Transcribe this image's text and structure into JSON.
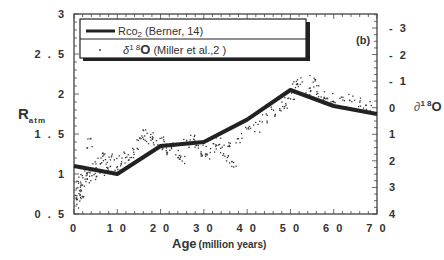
{
  "chart_data": {
    "type": "line+scatter",
    "panel_label": "(b)",
    "title": "",
    "xlabel": "Age",
    "xlabel_units": "(million years)",
    "ylabel": "R",
    "ylabel_sub": "atm",
    "y2label": "∂¹⁸O",
    "xlim": [
      0,
      70
    ],
    "ylim": [
      0.5,
      3
    ],
    "y2lim": [
      4,
      -3.5
    ],
    "y2_reversed": true,
    "grid": false,
    "legend_position": "upper-left",
    "x_ticks": [
      "0",
      "1 0",
      "2 0",
      "3 0",
      "4 0",
      "5 0",
      "6 0",
      "7 0"
    ],
    "x_tick_values": [
      0,
      10,
      20,
      30,
      40,
      50,
      60,
      70
    ],
    "y_ticks": [
      "0 . 5",
      "1",
      "1 . 5",
      "2",
      "2 . 5",
      "3"
    ],
    "y_tick_values": [
      0.5,
      1,
      1.5,
      2,
      2.5,
      3
    ],
    "y2_ticks": [
      "- 3",
      "- 2",
      "- 1",
      "0",
      "1",
      "2",
      "3",
      "4"
    ],
    "y2_tick_values": [
      -3,
      -2,
      -1,
      0,
      1,
      2,
      3,
      4
    ],
    "legend": [
      {
        "label_main": "Rco",
        "label_sub": "2",
        "label_rest": "  (Berner, 14)",
        "style": "thick-line"
      },
      {
        "label_main": "δ",
        "label_sup": "1 8",
        "label_o": "O",
        "label_rest": " (Miller et al.,2 )",
        "style": "dot"
      }
    ],
    "series": [
      {
        "name": "RCO2 (Berner, 14)",
        "type": "line",
        "x": [
          0,
          10,
          20,
          30,
          40,
          50,
          60,
          70
        ],
        "values": [
          1.1,
          1.0,
          1.35,
          1.4,
          1.68,
          2.05,
          1.85,
          1.75
        ]
      },
      {
        "name": "δ18O (Miller et al., 2)",
        "type": "scatter",
        "note": "dense cloud of points, approximate envelope sampled",
        "x": [
          0.5,
          1,
          1.5,
          2,
          2.5,
          3,
          0.8,
          1.2,
          2.2,
          3.5,
          4,
          5,
          5.5,
          6,
          6.5,
          7,
          8,
          9,
          10,
          11,
          12,
          13,
          14,
          15,
          16,
          17,
          18,
          19,
          20,
          21,
          22,
          23,
          24,
          25,
          26,
          27,
          28,
          29,
          30,
          31,
          32,
          33,
          34,
          35,
          36,
          37,
          38,
          40,
          42,
          44,
          46,
          48,
          49,
          50,
          51,
          52,
          54,
          55,
          56,
          57,
          58,
          60,
          62,
          64,
          66,
          68
        ],
        "values": [
          0.7,
          0.8,
          0.9,
          0.75,
          1.0,
          0.95,
          0.65,
          0.85,
          1.05,
          1.4,
          1.05,
          1.1,
          1.0,
          1.15,
          1.2,
          1.05,
          1.15,
          1.2,
          1.1,
          1.2,
          1.25,
          1.15,
          1.3,
          1.45,
          1.5,
          1.45,
          1.5,
          1.4,
          1.4,
          1.35,
          1.3,
          1.35,
          1.25,
          1.2,
          1.4,
          1.45,
          1.4,
          1.3,
          1.3,
          1.25,
          1.35,
          1.4,
          1.3,
          1.2,
          1.4,
          1.15,
          1.45,
          1.55,
          1.6,
          1.7,
          1.8,
          1.85,
          1.9,
          2.0,
          2.1,
          2.15,
          2.05,
          2.2,
          2.05,
          2.0,
          1.95,
          1.95,
          1.9,
          1.95,
          1.9,
          1.85
        ]
      }
    ]
  }
}
